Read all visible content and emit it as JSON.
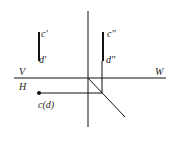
{
  "diagram": {
    "type": "orthographic-projection",
    "labels": {
      "c_front": "c′",
      "d_front": "d′",
      "c_side": "c″",
      "d_side": "d″",
      "plane_v": "V",
      "plane_h": "H",
      "plane_w": "W",
      "cd_top": "c(d)"
    },
    "colors": {
      "line": "#111111",
      "background": "#ffffff"
    }
  }
}
